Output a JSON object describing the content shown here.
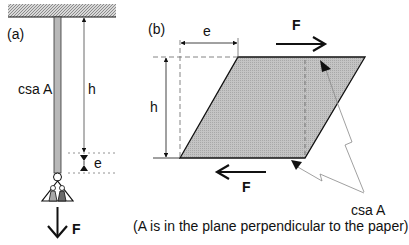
{
  "panel_a": {
    "label": "(a)",
    "csa_label": "csa A",
    "h_label": "h",
    "e_label": "e",
    "force_label": "F"
  },
  "panel_b": {
    "label": "(b)",
    "e_label": "e",
    "h_label": "h",
    "force_top_label": "F",
    "force_bottom_label": "F",
    "csa_label": "csa A",
    "caption": "(A is in the plane perpendicular to the paper)"
  },
  "colors": {
    "shade": "#bdbdbd",
    "rod": "#b0b0b0",
    "line": "#111111",
    "weight_light": "#a8a8a8",
    "weight_dark": "#6a6a6a"
  }
}
